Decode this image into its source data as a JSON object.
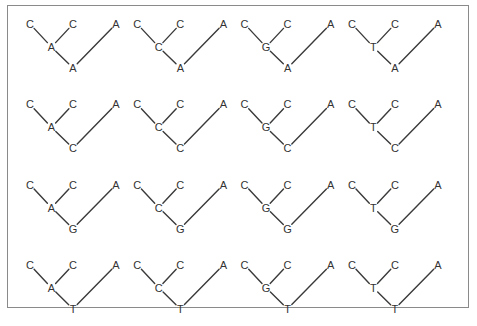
{
  "figure": {
    "leaves": [
      "C",
      "C",
      "A"
    ],
    "grid": {
      "rows": 4,
      "cols": 4
    },
    "internal_node_states_by_column": [
      "A",
      "C",
      "G",
      "T"
    ],
    "root_states_by_row": [
      "A",
      "C",
      "G",
      "T"
    ],
    "trees": [
      {
        "row": 0,
        "col": 0,
        "leaves": [
          "C",
          "C",
          "A"
        ],
        "internal": "A",
        "root": "A"
      },
      {
        "row": 0,
        "col": 1,
        "leaves": [
          "C",
          "C",
          "A"
        ],
        "internal": "C",
        "root": "A"
      },
      {
        "row": 0,
        "col": 2,
        "leaves": [
          "C",
          "C",
          "A"
        ],
        "internal": "G",
        "root": "A"
      },
      {
        "row": 0,
        "col": 3,
        "leaves": [
          "C",
          "C",
          "A"
        ],
        "internal": "T",
        "root": "A"
      },
      {
        "row": 1,
        "col": 0,
        "leaves": [
          "C",
          "C",
          "A"
        ],
        "internal": "A",
        "root": "C"
      },
      {
        "row": 1,
        "col": 1,
        "leaves": [
          "C",
          "C",
          "A"
        ],
        "internal": "C",
        "root": "C"
      },
      {
        "row": 1,
        "col": 2,
        "leaves": [
          "C",
          "C",
          "A"
        ],
        "internal": "G",
        "root": "C"
      },
      {
        "row": 1,
        "col": 3,
        "leaves": [
          "C",
          "C",
          "A"
        ],
        "internal": "T",
        "root": "C"
      },
      {
        "row": 2,
        "col": 0,
        "leaves": [
          "C",
          "C",
          "A"
        ],
        "internal": "A",
        "root": "G"
      },
      {
        "row": 2,
        "col": 1,
        "leaves": [
          "C",
          "C",
          "A"
        ],
        "internal": "C",
        "root": "G"
      },
      {
        "row": 2,
        "col": 2,
        "leaves": [
          "C",
          "C",
          "A"
        ],
        "internal": "G",
        "root": "G"
      },
      {
        "row": 2,
        "col": 3,
        "leaves": [
          "C",
          "C",
          "A"
        ],
        "internal": "T",
        "root": "G"
      },
      {
        "row": 3,
        "col": 0,
        "leaves": [
          "C",
          "C",
          "A"
        ],
        "internal": "A",
        "root": "T"
      },
      {
        "row": 3,
        "col": 1,
        "leaves": [
          "C",
          "C",
          "A"
        ],
        "internal": "C",
        "root": "T"
      },
      {
        "row": 3,
        "col": 2,
        "leaves": [
          "C",
          "C",
          "A"
        ],
        "internal": "G",
        "root": "T"
      },
      {
        "row": 3,
        "col": 3,
        "leaves": [
          "C",
          "C",
          "A"
        ],
        "internal": "T",
        "root": "T"
      }
    ]
  },
  "colors": {
    "frame": "#8a8a8a",
    "edge": "#3a3a3a",
    "text": "#333333"
  }
}
